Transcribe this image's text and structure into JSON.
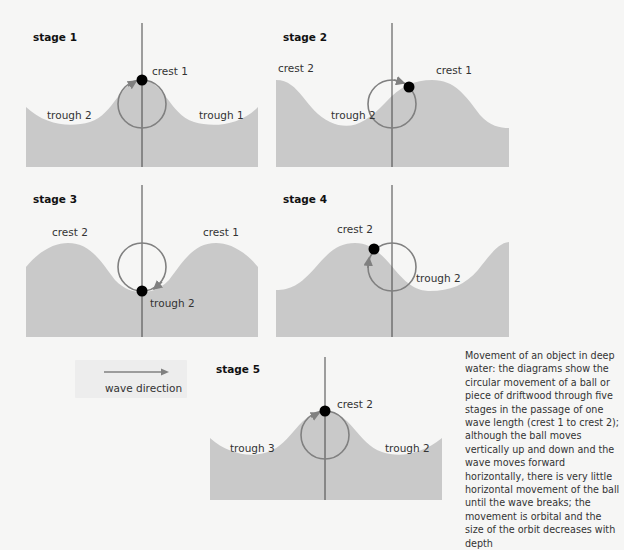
{
  "colors": {
    "background": "#f6f6f5",
    "water": "#c9c9c9",
    "orbit": "#808080",
    "axis": "#444444",
    "ball": "#000000"
  },
  "stages": [
    {
      "title": "stage 1",
      "labels": {
        "a": "crest 1",
        "b": "trough 2",
        "c": "trough 1"
      }
    },
    {
      "title": "stage 2",
      "labels": {
        "a": "crest 2",
        "b": "crest 1",
        "c": "trough 2"
      }
    },
    {
      "title": "stage 3",
      "labels": {
        "a": "crest 2",
        "b": "crest 1",
        "c": "trough 2"
      }
    },
    {
      "title": "stage 4",
      "labels": {
        "a": "crest 2",
        "b": "trough 2"
      }
    },
    {
      "title": "stage 5",
      "labels": {
        "a": "crest 2",
        "b": "trough 3",
        "c": "trough 2"
      }
    }
  ],
  "legend": {
    "label": "wave direction",
    "icon": "arrow-right-icon"
  },
  "caption": "Movement of an object in deep water: the diagrams show the circular movement of a ball or piece of driftwood through five stages in the passage of one wave length (crest 1 to crest 2); although the ball moves vertically up and down and the wave moves forward horizontally, there is very little horizontal movement of the ball until the wave breaks; the movement is orbital and the size of the orbit decreases with depth"
}
